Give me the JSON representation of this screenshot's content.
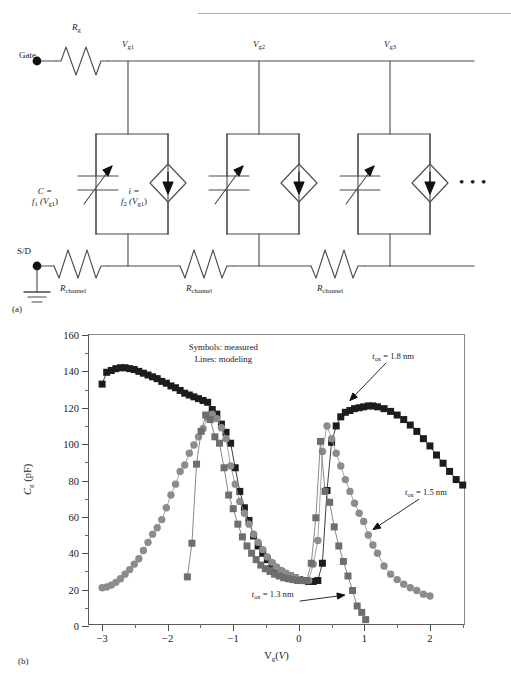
{
  "header": {
    "text": "",
    "rule_color": "#a9a9a9"
  },
  "figure": {
    "panel_a_tag": "(a)",
    "panel_b_tag": "(b)"
  },
  "circuit": {
    "title_labels": {
      "gate": "Gate",
      "sd": "S/D",
      "rg": "R",
      "rg_sub": "g",
      "node1": "V",
      "node1_sub": "g1",
      "node2": "V",
      "node2_sub": "g2",
      "node3": "V",
      "node3_sub": "g3",
      "cap_line1": "C =",
      "cap_line2_f": "f",
      "cap_line2_fsub": "1",
      "cap_line2_arg": "(V",
      "cap_line2_argsub": "g1",
      "cap_line2_close": ")",
      "cur_line1": "i =",
      "cur_line2_f": "f",
      "cur_line2_fsub": "2",
      "cur_line2_arg": "(V",
      "cur_line2_argsub": "g1",
      "cur_line2_close": ")",
      "rchannel": "R",
      "rchannel_sub": "channel",
      "ellipsis": "• • •"
    },
    "elements": {
      "variable_capacitor": "variable-capacitor",
      "current_source": "dependent-current-source",
      "resistor": "resistor",
      "ground": "ground",
      "terminal_node": "terminal-dot"
    },
    "stage_count": 3,
    "line_color": "#4a4a4a"
  },
  "chart_data": {
    "type": "scatter",
    "title": "",
    "xlabel": "V_g (V)",
    "ylabel": "C_g (pF)",
    "xlim": [
      -3.2,
      2.55
    ],
    "ylim": [
      0,
      160
    ],
    "xticks": [
      -3,
      -2,
      -1,
      0,
      1,
      2
    ],
    "yticks": [
      0,
      20,
      40,
      60,
      80,
      100,
      120,
      140,
      160
    ],
    "xtick_labels": [
      "−3",
      "−2",
      "−1",
      "0",
      "1",
      "2"
    ],
    "ytick_labels": [
      "0",
      "20",
      "40",
      "60",
      "80",
      "100",
      "120",
      "140",
      "160"
    ],
    "xminor_step": 0.5,
    "yminor_step": 10,
    "grid": false,
    "legend_position": "inside-top-center",
    "legend_note_line1": "Symbols: measured",
    "legend_note_line2": "Lines: modeling",
    "annotations": [
      {
        "name": "tox-1p8-label",
        "text": "t_ox = 1.8 nm",
        "t_text": "t",
        "sub": "ox",
        "rest": " = 1.8 nm",
        "x": 1.1,
        "y": 148
      },
      {
        "name": "tox-1p5-label",
        "text": "t_ox = 1.5 nm",
        "t_text": "t",
        "sub": "ox",
        "rest": " = 1.5 nm",
        "x": 1.55,
        "y": 72
      },
      {
        "name": "tox-1p3-label",
        "text": "t_ox = 1.3 nm",
        "t_text": "t",
        "sub": "ox",
        "rest": " = 1.3 nm",
        "x": 0.0,
        "y": 16
      }
    ],
    "series": [
      {
        "name": "t_ox = 1.8 nm",
        "label": "t_ox = 1.8 nm",
        "marker": "square",
        "color": "#1c1c1c",
        "line_color": "#2a2a2a",
        "x": [
          -3.0,
          -2.93,
          -2.86,
          -2.79,
          -2.72,
          -2.65,
          -2.58,
          -2.51,
          -2.44,
          -2.37,
          -2.3,
          -2.23,
          -2.16,
          -2.09,
          -2.02,
          -1.95,
          -1.88,
          -1.81,
          -1.74,
          -1.67,
          -1.6,
          -1.53,
          -1.46,
          -1.39,
          -1.32,
          -1.25,
          -1.18,
          -1.11,
          -1.04,
          -0.97,
          -0.9,
          -0.83,
          -0.76,
          -0.69,
          -0.62,
          -0.55,
          -0.48,
          -0.41,
          -0.34,
          -0.27,
          -0.2,
          -0.13,
          -0.06,
          0.01,
          0.08,
          0.15,
          0.22,
          0.29,
          0.36,
          0.43,
          0.5,
          0.57,
          0.64,
          0.71,
          0.78,
          0.85,
          0.92,
          0.99,
          1.06,
          1.13,
          1.2,
          1.3,
          1.4,
          1.5,
          1.6,
          1.7,
          1.8,
          1.9,
          2.0,
          2.1,
          2.2,
          2.3,
          2.4,
          2.5
        ],
        "y": [
          133.0,
          139.5,
          140.5,
          141.5,
          142.0,
          142.0,
          141.5,
          141.0,
          140.0,
          139.0,
          138.0,
          137.0,
          136.0,
          134.5,
          133.5,
          132.0,
          131.0,
          129.5,
          128.0,
          127.0,
          126.0,
          125.0,
          124.0,
          123.0,
          119.0,
          116.5,
          111.0,
          106.5,
          100.5,
          87.0,
          74.0,
          65.0,
          58.0,
          49.5,
          44.0,
          40.0,
          36.5,
          34.0,
          31.5,
          30.0,
          28.5,
          27.5,
          26.5,
          25.5,
          25.0,
          24.5,
          24.5,
          25.0,
          34.5,
          74.5,
          101.0,
          110.0,
          115.0,
          117.5,
          118.5,
          119.5,
          120.0,
          120.5,
          121.0,
          121.0,
          120.5,
          119.5,
          118.0,
          116.0,
          113.5,
          110.5,
          107.0,
          103.0,
          99.0,
          94.0,
          89.5,
          85.0,
          80.5,
          77.5
        ]
      },
      {
        "name": "t_ox = 1.5 nm",
        "label": "t_ox = 1.5 nm",
        "marker": "circle",
        "color": "#8c8c8c",
        "line_color": "#9a9a9a",
        "x": [
          -3.0,
          -2.93,
          -2.86,
          -2.79,
          -2.72,
          -2.65,
          -2.58,
          -2.51,
          -2.44,
          -2.37,
          -2.3,
          -2.23,
          -2.16,
          -2.09,
          -2.02,
          -1.95,
          -1.88,
          -1.81,
          -1.74,
          -1.67,
          -1.6,
          -1.53,
          -1.46,
          -1.39,
          -1.32,
          -1.25,
          -1.18,
          -1.11,
          -1.04,
          -0.97,
          -0.9,
          -0.83,
          -0.76,
          -0.69,
          -0.62,
          -0.55,
          -0.48,
          -0.41,
          -0.34,
          -0.27,
          -0.2,
          -0.13,
          -0.06,
          0.01,
          0.08,
          0.15,
          0.22,
          0.29,
          0.36,
          0.43,
          0.5,
          0.57,
          0.64,
          0.71,
          0.78,
          0.85,
          0.92,
          0.99,
          1.06,
          1.13,
          1.2,
          1.3,
          1.4,
          1.5,
          1.6,
          1.7,
          1.8,
          1.9,
          2.0
        ],
        "y": [
          21.0,
          21.5,
          22.5,
          24.0,
          26.0,
          28.5,
          31.0,
          34.0,
          37.0,
          41.5,
          46.0,
          50.5,
          54.0,
          58.5,
          65.0,
          72.0,
          78.0,
          85.0,
          88.5,
          95.0,
          99.5,
          104.0,
          108.5,
          114.5,
          116.5,
          114.0,
          109.0,
          103.0,
          88.0,
          78.0,
          68.5,
          62.0,
          56.0,
          50.5,
          46.0,
          42.0,
          38.0,
          35.0,
          32.5,
          30.5,
          29.0,
          27.5,
          26.5,
          25.5,
          25.0,
          25.0,
          34.0,
          47.0,
          96.0,
          110.0,
          103.0,
          95.0,
          88.0,
          80.5,
          74.0,
          67.5,
          62.0,
          57.5,
          50.0,
          44.5,
          40.0,
          33.0,
          28.5,
          25.5,
          23.0,
          21.0,
          19.5,
          17.5,
          16.5
        ]
      },
      {
        "name": "t_ox = 1.3 nm",
        "label": "t_ox = 1.3 nm",
        "marker": "square",
        "color": "#6e6e6e",
        "line_color": "#7c7c7c",
        "x": [
          -1.7,
          -1.63,
          -1.56,
          -1.49,
          -1.42,
          -1.35,
          -1.28,
          -1.21,
          -1.14,
          -1.07,
          -1.0,
          -0.93,
          -0.86,
          -0.79,
          -0.72,
          -0.65,
          -0.58,
          -0.51,
          -0.44,
          -0.37,
          -0.3,
          -0.23,
          -0.16,
          -0.09,
          -0.02,
          0.05,
          0.12,
          0.19,
          0.26,
          0.33,
          0.4,
          0.47,
          0.54,
          0.61,
          0.68,
          0.75,
          0.82,
          0.89,
          0.96,
          1.02
        ],
        "y": [
          27.0,
          45.5,
          89.0,
          107.0,
          116.0,
          113.5,
          104.0,
          100.5,
          87.0,
          72.0,
          64.5,
          56.0,
          49.0,
          44.0,
          40.0,
          36.5,
          33.5,
          31.5,
          30.0,
          28.5,
          27.5,
          26.5,
          26.0,
          25.5,
          25.0,
          25.0,
          25.0,
          34.5,
          59.5,
          101.5,
          74.0,
          68.0,
          54.5,
          44.0,
          35.5,
          27.5,
          19.5,
          11.0,
          7.5,
          3.5
        ]
      }
    ]
  }
}
